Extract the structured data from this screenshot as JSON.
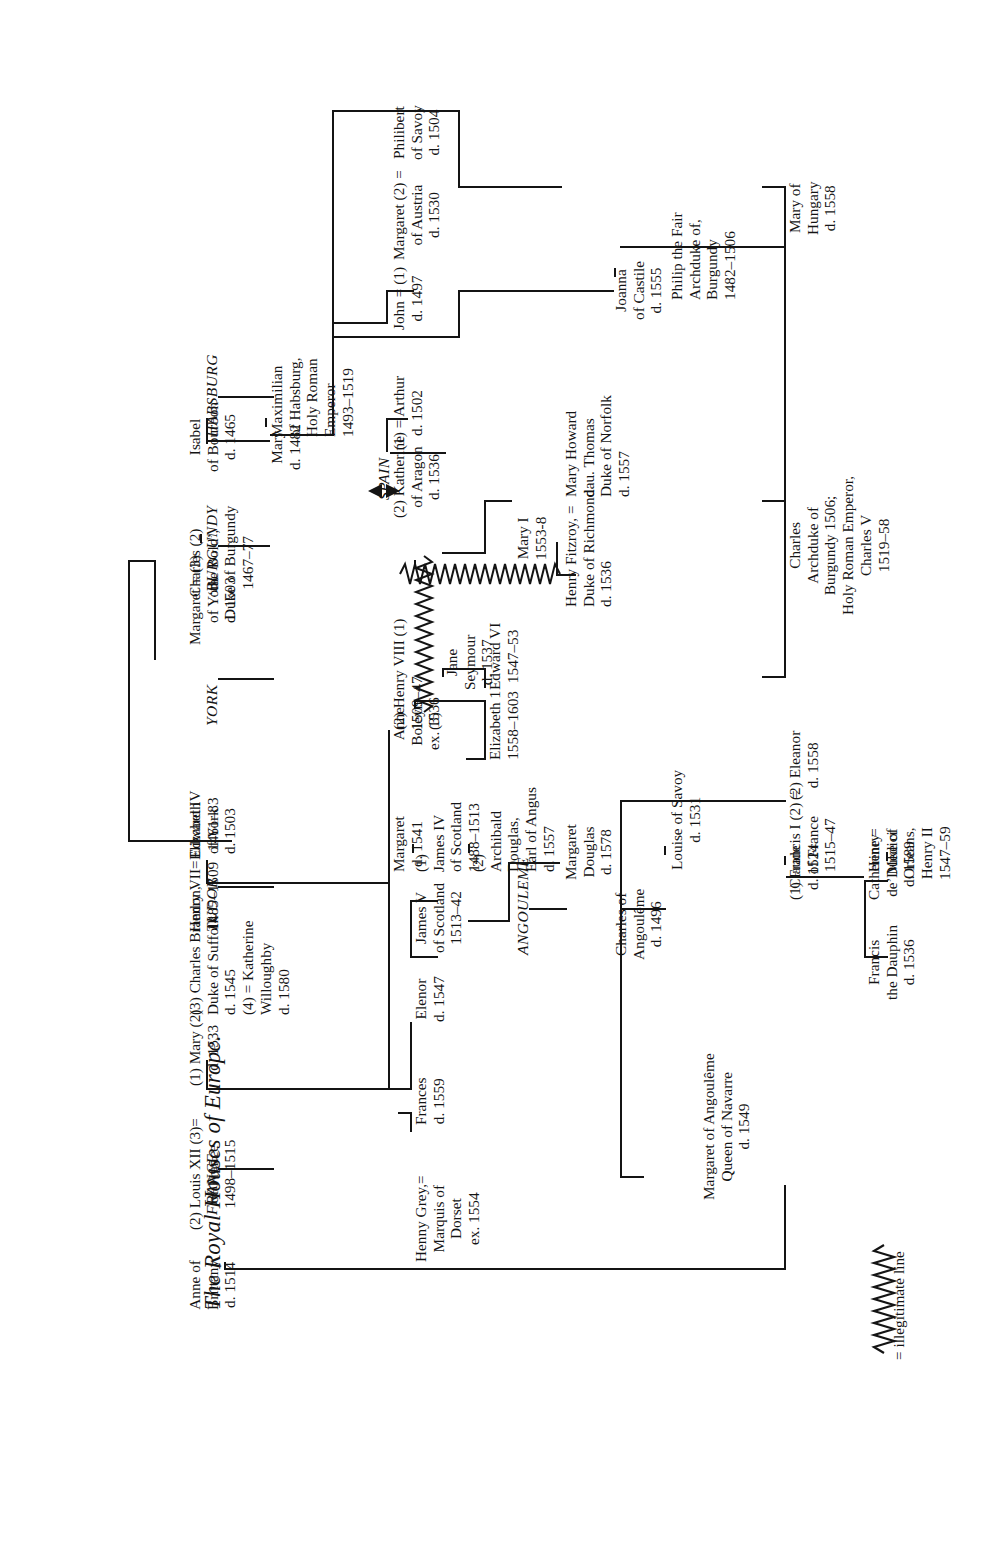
{
  "document": {
    "title": "The Royal Houses of Europe.",
    "legend": {
      "symbol": "zigzag-line",
      "text": "= illegitimate line"
    }
  },
  "houses": [
    {
      "id": "france",
      "label": "FRANCE"
    },
    {
      "id": "tudor",
      "label": "TUDOR"
    },
    {
      "id": "york",
      "label": "YORK"
    },
    {
      "id": "burgundy",
      "label": "BURGUNDY"
    },
    {
      "id": "habsburg",
      "label": "HABSBURG"
    },
    {
      "id": "spain",
      "label": "SPAIN"
    },
    {
      "id": "angouleme",
      "label": "ANGOULEME"
    }
  ],
  "people": [
    {
      "id": "anne-brittany",
      "lines": [
        "Anne of",
        "Brittany",
        "d. 1514"
      ]
    },
    {
      "id": "louis-xii",
      "lines": [
        "(2) Louis XII  (3)=",
        "of France",
        "1498–1515"
      ]
    },
    {
      "id": "mary-tudor",
      "lines": [
        "(1) Mary (2)",
        "d. 1533"
      ]
    },
    {
      "id": "charles-brandon",
      "lines": [
        "(3) Charles Brandon,",
        "Duke of Suffolk",
        "d. 1545",
        "(4) = Katherine",
        "Willoughby",
        "d. 1580"
      ]
    },
    {
      "id": "henry-grey",
      "lines": [
        "Henny Grey,=",
        "Marquis of",
        "Dorset",
        "ex. 1554"
      ]
    },
    {
      "id": "frances",
      "lines": [
        "Frances",
        "d. 1559"
      ]
    },
    {
      "id": "elenor",
      "lines": [
        "Elenor",
        "d. 1547"
      ]
    },
    {
      "id": "james-v",
      "lines": [
        "James V",
        "of Scotland",
        "1513–42"
      ]
    },
    {
      "id": "margaret-tudor",
      "lines": [
        "Margaret",
        "d. 1541"
      ]
    },
    {
      "id": "james-iv",
      "lines": [
        "(1)",
        "James IV",
        "of Scotland",
        "1488–1513"
      ]
    },
    {
      "id": "archibald",
      "lines": [
        "(2)",
        "Archibald",
        "Douglas,",
        "Earl of Angus",
        "d. 1557"
      ]
    },
    {
      "id": "margaret-douglas",
      "lines": [
        "Margaret",
        "Douglas",
        "d. 1578"
      ]
    },
    {
      "id": "henry-vii",
      "lines": [
        "Henry VII=",
        "1485–1509"
      ]
    },
    {
      "id": "elizabeth-york",
      "lines": [
        "Elizabeth",
        "of York",
        "d. 1503"
      ]
    },
    {
      "id": "edward-iv",
      "lines": [
        "Edward IV",
        "1461–83"
      ]
    },
    {
      "id": "margaret-york",
      "lines": [
        "Margaret  = (3)",
        "of York",
        "d. 1503"
      ]
    },
    {
      "id": "charles-bold",
      "lines": [
        "Charles (2)",
        "‘the Bold’,",
        "Duke of Burgundy",
        "1467–77"
      ]
    },
    {
      "id": "isabel-bourbon",
      "lines": [
        "Isabel",
        "of Bourbon",
        "d. 1465"
      ]
    },
    {
      "id": "mary-burgundy",
      "lines": [
        "Mary",
        "d. 1482"
      ]
    },
    {
      "id": "maximilian",
      "lines": [
        "Maximilian",
        "of Habsburg,",
        "Holy Roman",
        "Emperor",
        "1493–1519"
      ]
    },
    {
      "id": "henry-viii",
      "lines": [
        "(2) Henry VIII (1)",
        "1509–47",
        "(3)"
      ]
    },
    {
      "id": "anne-boleyn",
      "lines": [
        "Anne",
        "Boleyn",
        "ex. 1536"
      ]
    },
    {
      "id": "jane-seymour",
      "lines": [
        "Jane",
        "Seymour",
        "d. 1537"
      ]
    },
    {
      "id": "katherine-aragon",
      "lines": [
        "(2) Katherine",
        "of Aragon",
        "d. 1536"
      ]
    },
    {
      "id": "arthur",
      "lines": [
        "(1) = Arthur",
        "d. 1502"
      ]
    },
    {
      "id": "elizabeth-i",
      "lines": [
        "Elizabeth 1",
        "1558–1603"
      ]
    },
    {
      "id": "edward-vi",
      "lines": [
        "Edward VI",
        "1547–53"
      ]
    },
    {
      "id": "mary-i",
      "lines": [
        "Mary I",
        "1553-8"
      ]
    },
    {
      "id": "henry-fitzroy",
      "lines": [
        "Henry Fitzroy,  =",
        "Duke of Richmond",
        "d. 1536"
      ]
    },
    {
      "id": "mary-howard",
      "lines": [
        "Mary Howard",
        "dau. Thomas",
        "Duke of Norfolk",
        "d. 1557"
      ]
    },
    {
      "id": "john-spain",
      "lines": [
        "John = (1)",
        "d. 1497"
      ]
    },
    {
      "id": "margaret-austria",
      "lines": [
        "Margaret (2)  =",
        "of Austria",
        "d. 1530"
      ]
    },
    {
      "id": "philibert",
      "lines": [
        "Philibert",
        "of Savoy",
        "d. 1504"
      ]
    },
    {
      "id": "joanna-castile",
      "lines": [
        "Joanna",
        "of Castile",
        "d. 1555"
      ]
    },
    {
      "id": "philip-fair",
      "lines": [
        "Philip the Fair",
        "Archduke of,",
        "Burgundy",
        "1482–1506"
      ]
    },
    {
      "id": "mary-hungary",
      "lines": [
        "Mary of",
        "Hungary",
        "d. 1558"
      ]
    },
    {
      "id": "charles-v",
      "lines": [
        "Charles",
        "Archduke of",
        "Burgundy 1506;",
        "Holy Roman Emperor,",
        "Charles V",
        "1519–58"
      ]
    },
    {
      "id": "eleanor",
      "lines": [
        "(2) Eleanor",
        "d. 1558"
      ]
    },
    {
      "id": "francis-i",
      "lines": [
        "(1) Francis I (2)  =",
        "of France",
        "1515–47"
      ]
    },
    {
      "id": "claude",
      "lines": [
        "Claude",
        "d. 1524"
      ]
    },
    {
      "id": "francis-dauphin",
      "lines": [
        "Francis",
        "the Dauphin",
        "d. 1536"
      ]
    },
    {
      "id": "catherine-medici",
      "lines": [
        "Catherine  =",
        "de’ Medici",
        "d. 1589"
      ]
    },
    {
      "id": "henry-ii",
      "lines": [
        "Henry",
        "Duke of",
        "Orleans,",
        "Henry II",
        "1547–59"
      ]
    },
    {
      "id": "charles-angouleme",
      "lines": [
        "Charles of",
        "Angoulême",
        "d. 1496"
      ]
    },
    {
      "id": "louise-savoy",
      "lines": [
        "Louise of Savoy",
        "d. 1531"
      ]
    },
    {
      "id": "margaret-navarre",
      "lines": [
        "Margaret of Angoulême",
        "Queen of Navarre",
        "d. 1549"
      ]
    }
  ]
}
